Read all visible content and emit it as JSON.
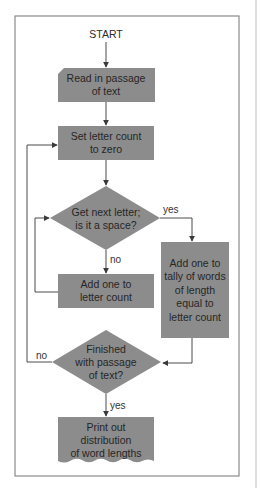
{
  "colors": {
    "background": "#ffffff",
    "frame": "#8a8a8a",
    "node_fill": "#8c8c8c",
    "line": "#4a4a4a",
    "text": "#262626"
  },
  "flowchart": {
    "start_label": "START",
    "nodes": [
      {
        "id": "read",
        "shape": "card",
        "lines": [
          "Read in passage",
          "of text"
        ]
      },
      {
        "id": "reset",
        "shape": "process",
        "lines": [
          "Set letter count",
          "to zero"
        ]
      },
      {
        "id": "get-letter",
        "shape": "decision",
        "lines": [
          "Get next letter;",
          "is it a space?"
        ]
      },
      {
        "id": "add-letter",
        "shape": "process",
        "lines": [
          "Add one to",
          "letter count"
        ]
      },
      {
        "id": "tally",
        "shape": "process",
        "lines": [
          "Add one to",
          "tally of words",
          "of length",
          "equal to",
          "letter count"
        ]
      },
      {
        "id": "finished",
        "shape": "decision",
        "lines": [
          "Finished",
          "with passage",
          "of text?"
        ]
      },
      {
        "id": "print",
        "shape": "document",
        "lines": [
          "Print out",
          "distribution",
          "of word lengths"
        ]
      }
    ],
    "edge_labels": {
      "get_letter_yes": "yes",
      "get_letter_no": "no",
      "finished_no": "no",
      "finished_yes": "yes"
    }
  }
}
